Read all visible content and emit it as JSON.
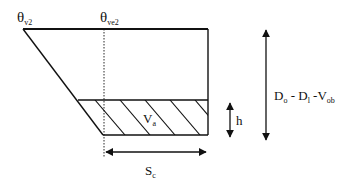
{
  "diagram": {
    "labels": {
      "theta_v2": {
        "base": "θ",
        "sub": "v2"
      },
      "theta_ve2": {
        "base": "θ",
        "sub": "ve2"
      },
      "va": {
        "base": "V",
        "sub": "a"
      },
      "h": {
        "base": "h"
      },
      "sc": {
        "base": "S",
        "sub": "c"
      },
      "depth": {
        "parts": [
          {
            "base": "D",
            "sub": "o"
          },
          {
            "text": " - "
          },
          {
            "base": "D",
            "sub": "l"
          },
          {
            "text": " -"
          },
          {
            "base": "V",
            "sub": "ob"
          }
        ]
      }
    },
    "colors": {
      "line": "#111111",
      "background": "#ffffff"
    }
  }
}
